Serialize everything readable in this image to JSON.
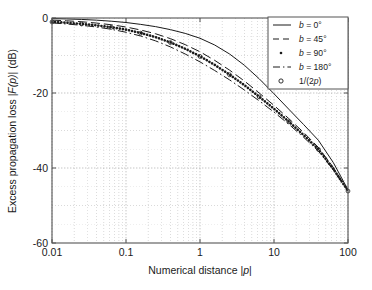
{
  "chart_data": {
    "type": "line",
    "title": "",
    "xlabel": "Numerical distance |p|",
    "ylabel": "Excess propagation loss |F(p)| (dB)",
    "xscale": "log",
    "xlim": [
      0.01,
      100
    ],
    "ylim": [
      -60,
      0
    ],
    "xticks": [
      "0.01",
      "0.1",
      "1",
      "10",
      "100"
    ],
    "xtick_values": [
      0.01,
      0.1,
      1,
      10,
      100
    ],
    "yticks": [
      "0",
      "-20",
      "-40",
      "-60"
    ],
    "ytick_values": [
      0,
      -20,
      -40,
      -60
    ],
    "grid": true,
    "grid_minor": true,
    "legend_position": "top-right",
    "x": [
      0.01,
      0.0158,
      0.0251,
      0.0398,
      0.0631,
      0.1,
      0.158,
      0.251,
      0.398,
      0.631,
      1,
      1.58,
      2.51,
      3.98,
      6.31,
      10,
      15.8,
      25.1,
      39.8,
      63.1,
      100
    ],
    "series": [
      {
        "name": "b = 0°",
        "style": "solid",
        "values": [
          -0.15,
          -0.25,
          -0.38,
          -0.58,
          -0.85,
          -1.2,
          -1.7,
          -2.3,
          -3.1,
          -4.1,
          -5.4,
          -7.2,
          -9.6,
          -12.6,
          -16.2,
          -20.2,
          -24.3,
          -28.4,
          -32.6,
          -38.5,
          -45.8
        ]
      },
      {
        "name": "b = 45°",
        "style": "dashed",
        "values": [
          -0.55,
          -0.75,
          -1.0,
          -1.35,
          -1.8,
          -2.4,
          -3.2,
          -4.2,
          -5.5,
          -7.1,
          -9.0,
          -11.3,
          -13.9,
          -16.8,
          -20.0,
          -23.3,
          -26.8,
          -30.5,
          -34.5,
          -39.8,
          -46.0
        ]
      },
      {
        "name": "b = 90°",
        "style": "dotted",
        "values": [
          -1.0,
          -1.25,
          -1.55,
          -1.95,
          -2.45,
          -3.1,
          -4.0,
          -5.1,
          -6.5,
          -8.2,
          -10.2,
          -12.5,
          -15.1,
          -17.9,
          -21.0,
          -24.2,
          -27.6,
          -31.2,
          -35.0,
          -40.2,
          -46.1
        ]
      },
      {
        "name": "b = 180°",
        "style": "dashdot",
        "values": [
          -1.3,
          -1.6,
          -1.95,
          -2.4,
          -3.0,
          -3.8,
          -4.8,
          -6.1,
          -7.7,
          -9.6,
          -11.7,
          -14.0,
          -16.5,
          -19.2,
          -22.1,
          -25.1,
          -28.3,
          -31.8,
          -35.5,
          -40.5,
          -46.2
        ]
      },
      {
        "name": "1/(2p)",
        "style": "circles",
        "values": [
          -1.05,
          -1.3,
          -1.6,
          -2.0,
          -2.5,
          -3.15,
          -4.05,
          -5.15,
          -6.55,
          -8.25,
          -10.25,
          -12.55,
          -15.15,
          -17.95,
          -21.05,
          -24.25,
          -27.65,
          -31.25,
          -35.05,
          -40.25,
          -46.15
        ]
      }
    ]
  },
  "legend": {
    "entries": [
      {
        "label": "b = 0°"
      },
      {
        "label": "b = 45°"
      },
      {
        "label": "b = 90°"
      },
      {
        "label": "b = 180°"
      },
      {
        "label": "1/(2p)"
      }
    ]
  },
  "axes": {
    "xlabel": "Numerical distance |p|",
    "ylabel": "Excess propagation loss |F(p)| (dB)",
    "xtick_labels": [
      "0.01",
      "0.1",
      "1",
      "10",
      "100"
    ],
    "ytick_labels": [
      "0",
      "-20",
      "-40",
      "-60"
    ]
  },
  "colors": {
    "line": "#1a1a1a",
    "grid": "#9a9a9a",
    "axis": "#555555",
    "background": "#ffffff"
  }
}
